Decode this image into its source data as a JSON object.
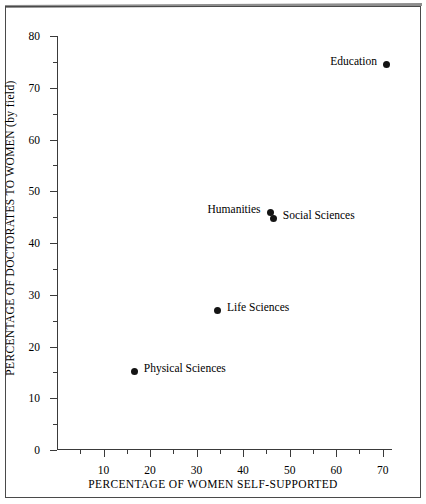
{
  "caption_fragment": "tt",
  "chart_data": {
    "type": "scatter",
    "title": "",
    "xlabel": "PERCENTAGE OF WOMEN SELF-SUPPORTED",
    "ylabel": "PERCENTAGE OF DOCTORATES TO WOMEN (by field)",
    "xlim": [
      0,
      72
    ],
    "ylim": [
      0,
      80
    ],
    "grid": false,
    "legend": "none",
    "x_major_ticks": [
      10,
      20,
      30,
      40,
      50,
      60,
      70
    ],
    "x_minor_ticks": [
      5,
      15,
      25,
      35,
      45,
      55,
      65
    ],
    "x_tick_labels": [
      "10",
      "20",
      "30",
      "40",
      "50",
      "60",
      "70"
    ],
    "y_major_ticks": [
      0,
      10,
      20,
      30,
      40,
      50,
      60,
      70,
      80
    ],
    "y_minor_ticks": [
      5,
      15,
      25,
      35,
      45,
      55,
      65,
      75
    ],
    "y_tick_labels": [
      "0",
      "10",
      "20",
      "30",
      "40",
      "50",
      "60",
      "70",
      "80"
    ],
    "points": [
      {
        "label": "Education",
        "x": 70.8,
        "y": 74.5,
        "label_side": "left"
      },
      {
        "label": "Humanities",
        "x": 45.8,
        "y": 45.8,
        "label_side": "left"
      },
      {
        "label": "Social Sciences",
        "x": 46.5,
        "y": 44.7,
        "label_side": "right"
      },
      {
        "label": "Life Sciences",
        "x": 34.5,
        "y": 26.9,
        "label_side": "right"
      },
      {
        "label": "Physical Sciences",
        "x": 16.6,
        "y": 15.1,
        "label_side": "right"
      }
    ]
  },
  "colors": {
    "marker": "#141414",
    "axis": "#3a3a3a",
    "frame": "#4a4a4a",
    "background": "#ffffff"
  }
}
